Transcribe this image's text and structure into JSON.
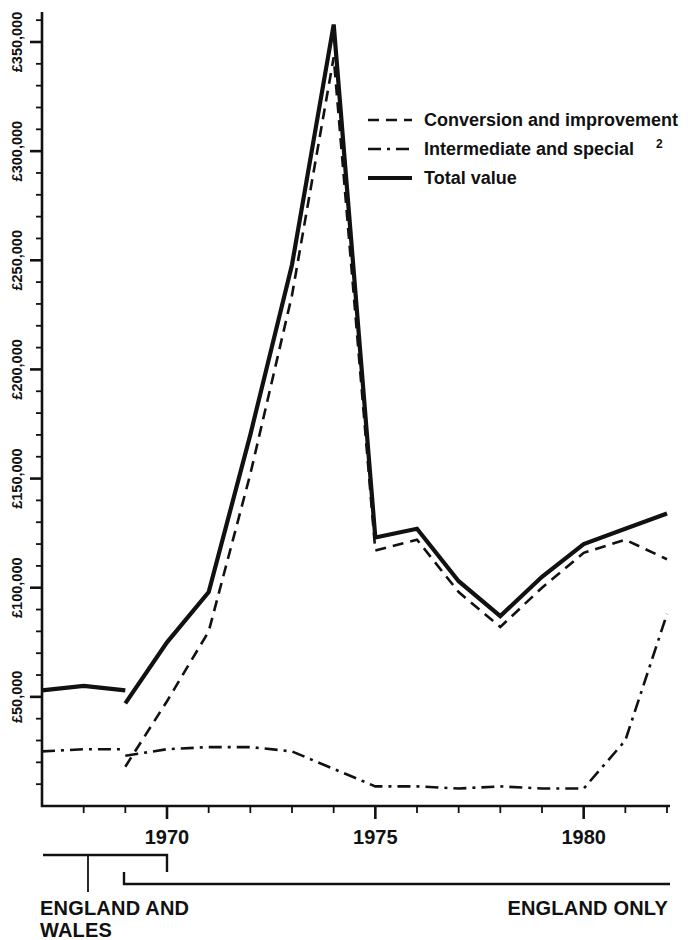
{
  "chart_data": {
    "type": "line",
    "title": "",
    "xlabel": "",
    "ylabel": "",
    "xlim": [
      1967,
      1982
    ],
    "ylim": [
      0,
      360000
    ],
    "y_tick_labels": [
      "£50,000",
      "£100,000",
      "£150,000",
      "£200,000",
      "£250,000",
      "£300,000",
      "£350,000"
    ],
    "y_tick_values": [
      50000,
      100000,
      150000,
      200000,
      250000,
      300000,
      350000
    ],
    "y_minor_interval": 10000,
    "x_tick_labels": [
      "1970",
      "1975",
      "1980"
    ],
    "x_tick_values": [
      1970,
      1975,
      1980
    ],
    "x_minor_interval": 1,
    "grid": false,
    "legend_position": "upper-right",
    "legend": [
      {
        "label": "Conversion and improvement",
        "style": "dashed"
      },
      {
        "label": "Intermediate and special",
        "superscript": "2",
        "style": "dash-dot"
      },
      {
        "label": "Total value",
        "style": "solid"
      }
    ],
    "x": [
      1967,
      1968,
      1969,
      1970,
      1971,
      1972,
      1973,
      1974,
      1975,
      1976,
      1977,
      1978,
      1979,
      1980,
      1981,
      1982
    ],
    "series": [
      {
        "name": "Total value",
        "style": "solid",
        "segments": [
          {
            "region": "England and Wales",
            "x": [
              1967,
              1968,
              1969
            ],
            "values": [
              53000,
              55000,
              53000
            ]
          },
          {
            "region": "England only",
            "x": [
              1969,
              1970,
              1971,
              1972,
              1973,
              1974,
              1975,
              1976,
              1977,
              1978,
              1979,
              1980,
              1981,
              1982
            ],
            "values": [
              47000,
              75000,
              98000,
              170000,
              248000,
              358000,
              123000,
              127000,
              103000,
              87000,
              105000,
              120000,
              127000,
              134000
            ]
          }
        ]
      },
      {
        "name": "Conversion and improvement",
        "style": "dashed",
        "segments": [
          {
            "region": "England only",
            "x": [
              1969,
              1970,
              1971,
              1972,
              1973,
              1974,
              1975,
              1976,
              1977,
              1978,
              1979,
              1980,
              1981,
              1982
            ],
            "values": [
              18000,
              48000,
              80000,
              152000,
              234000,
              343000,
              117000,
              122000,
              98000,
              82000,
              100000,
              116000,
              122000,
              113000
            ]
          }
        ]
      },
      {
        "name": "Intermediate and special",
        "style": "dash-dot",
        "segments": [
          {
            "region": "England and Wales",
            "x": [
              1967,
              1968,
              1969
            ],
            "values": [
              25000,
              26000,
              26000
            ]
          },
          {
            "region": "England only",
            "x": [
              1969,
              1970,
              1971,
              1972,
              1973,
              1974,
              1975,
              1976,
              1977,
              1978,
              1979,
              1980,
              1981,
              1982
            ],
            "values": [
              23000,
              26000,
              27000,
              27000,
              25000,
              17000,
              9000,
              9000,
              8000,
              9000,
              8000,
              8000,
              30000,
              88000
            ]
          }
        ]
      }
    ]
  },
  "footer": {
    "bracket_left_label_line1": "ENGLAND AND",
    "bracket_left_label_line2": "WALES",
    "bracket_right_label": "ENGLAND ONLY"
  },
  "axis_labels": {
    "y": [
      "£50,000",
      "£100,000",
      "£150,000",
      "£200,000",
      "£250,000",
      "£300,000",
      "£350,000"
    ],
    "x": [
      "1970",
      "1975",
      "1980"
    ]
  },
  "legend_items": [
    {
      "label": "Conversion and improvement",
      "sup": ""
    },
    {
      "label": "Intermediate and special",
      "sup": "2"
    },
    {
      "label": "Total value",
      "sup": ""
    }
  ]
}
